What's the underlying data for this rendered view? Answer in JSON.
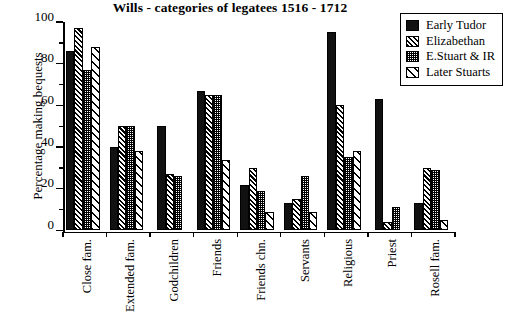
{
  "chart_data": {
    "type": "bar",
    "title": "Wills - categories of legatees 1516 - 1712",
    "xlabel": "",
    "ylabel": "Percentage making bequests",
    "ylim": [
      0,
      100
    ],
    "ytick_labels": [
      "0",
      "20",
      "40",
      "60",
      "80",
      "100"
    ],
    "ytick_values": [
      0,
      20,
      40,
      60,
      80,
      100
    ],
    "yminor_values": [
      10,
      30,
      50,
      70,
      90
    ],
    "grid": false,
    "legend_position": "top-right",
    "categories": [
      "Close fam.",
      "Extended fam.",
      "Godchildren",
      "Friends",
      "Friends chn.",
      "Servants",
      "Religious",
      "Priest",
      "Rosell fam."
    ],
    "series": [
      {
        "name": "Early Tudor",
        "pattern": "solid",
        "values": [
          86,
          40,
          50,
          67,
          22,
          13,
          95,
          63,
          13
        ]
      },
      {
        "name": "Elizabethan",
        "pattern": "dense-hatch",
        "values": [
          97,
          50,
          27,
          65,
          30,
          15,
          60,
          4,
          30
        ]
      },
      {
        "name": "E.Stuart & IR",
        "pattern": "stipple",
        "values": [
          77,
          50,
          26,
          65,
          19,
          26,
          35,
          11,
          29
        ]
      },
      {
        "name": "Later Stuarts",
        "pattern": "sparse-hatch",
        "values": [
          88,
          38,
          null,
          34,
          9,
          9,
          38,
          null,
          5
        ]
      }
    ]
  },
  "legend": {
    "items": [
      {
        "label": "Early Tudor"
      },
      {
        "label": "Elizabethan"
      },
      {
        "label": "E.Stuart & IR"
      },
      {
        "label": "Later Stuarts"
      }
    ]
  }
}
